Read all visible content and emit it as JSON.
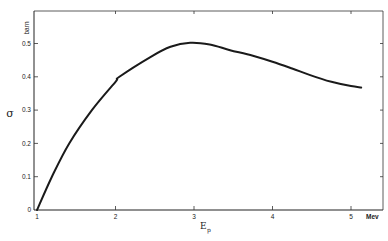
{
  "chart_data": {
    "type": "line",
    "title": "",
    "xlabel": "E_p",
    "xlabel_main": "E",
    "xlabel_sub": "p",
    "x_unit": "Mev",
    "ylabel": "σ",
    "y_unit": "barn",
    "xlim": [
      1,
      5.4
    ],
    "ylim": [
      0,
      0.55
    ],
    "grid": false,
    "legend": null,
    "x_ticks": [
      1,
      2,
      3,
      4,
      5
    ],
    "x_tick_labels": [
      "1",
      "2",
      "3",
      "4",
      "5"
    ],
    "y_ticks": [
      0,
      0.1,
      0.2,
      0.3,
      0.4,
      0.5
    ],
    "y_tick_labels": [
      "0",
      "0.1",
      "0.2",
      "0.3",
      "0.4",
      "0.5"
    ],
    "series": [
      {
        "name": "σ(E_p)",
        "color": "#1a1a1a",
        "x": [
          1.0,
          1.19,
          1.41,
          1.7,
          2.0,
          2.05,
          2.45,
          2.7,
          2.95,
          3.2,
          3.46,
          3.75,
          4.0,
          4.25,
          4.48,
          4.75,
          5.0,
          5.13
        ],
        "y": [
          0.0,
          0.1,
          0.2,
          0.3,
          0.385,
          0.4,
          0.46,
          0.49,
          0.502,
          0.497,
          0.48,
          0.463,
          0.445,
          0.425,
          0.405,
          0.385,
          0.372,
          0.368
        ]
      }
    ]
  },
  "axes": {
    "y_unit_label": "barn",
    "y_symbol": "σ",
    "x_unit_label": "Mev",
    "x_symbol": "E",
    "x_symbol_sub": "p"
  }
}
